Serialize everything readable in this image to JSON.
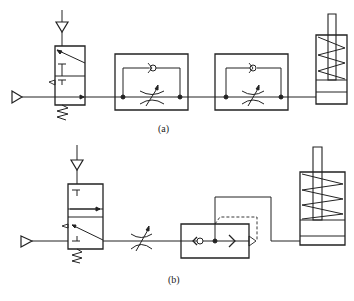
{
  "figure": {
    "subfigures": [
      {
        "id": "a",
        "label": "(a)",
        "components": [
          {
            "type": "pressure-source",
            "name": "exhaust-port-left"
          },
          {
            "type": "pressure-source",
            "name": "supply-port-top"
          },
          {
            "type": "3/2-way-valve",
            "name": "directional-valve",
            "actuation": "spring-return"
          },
          {
            "type": "one-way-flow-control-valve",
            "name": "flow-control-valve-1",
            "elements": [
              "check-valve",
              "adjustable-throttle"
            ]
          },
          {
            "type": "one-way-flow-control-valve",
            "name": "flow-control-valve-2",
            "elements": [
              "check-valve",
              "adjustable-throttle"
            ]
          },
          {
            "type": "single-acting-cylinder",
            "name": "cylinder",
            "actuation": "spring-return"
          }
        ]
      },
      {
        "id": "b",
        "label": "(b)",
        "components": [
          {
            "type": "pressure-source",
            "name": "exhaust-port-left"
          },
          {
            "type": "pressure-source",
            "name": "supply-port-top"
          },
          {
            "type": "3/2-way-valve",
            "name": "directional-valve",
            "actuation": "spring-return"
          },
          {
            "type": "adjustable-throttle",
            "name": "throttle-valve"
          },
          {
            "type": "quick-exhaust-valve",
            "name": "quick-exhaust-valve"
          },
          {
            "type": "single-acting-cylinder",
            "name": "cylinder",
            "actuation": "spring-return"
          }
        ]
      }
    ]
  },
  "colors": {
    "line": "#222222",
    "background": "#ffffff"
  }
}
